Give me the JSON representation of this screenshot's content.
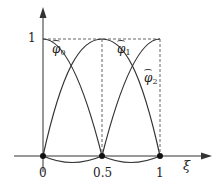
{
  "figure": {
    "axes": {
      "x_label": "ξ",
      "x_ticks": [
        "0",
        "0.5",
        "1"
      ],
      "y_ticks": [
        "1"
      ]
    },
    "functions": [
      {
        "name": "φ̂",
        "index": "0",
        "nodes_value_one_at": "0"
      },
      {
        "name": "φ̂",
        "index": "1",
        "nodes_value_one_at": "0.5"
      },
      {
        "name": "φ̂",
        "index": "2",
        "nodes_value_one_at": "1"
      }
    ],
    "nodes": [
      "0",
      "0.5",
      "1"
    ],
    "colors": {
      "line": "#333333",
      "dashed": "#555555",
      "background": "#ffffff"
    }
  }
}
